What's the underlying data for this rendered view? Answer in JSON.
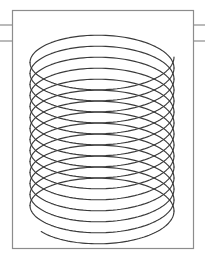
{
  "figure": {
    "kind": "technical-line-drawing",
    "background_color": "#ffffff",
    "frame": {
      "name": "drawing-border",
      "x": 12,
      "y": 10,
      "width": 181,
      "height": 238,
      "stroke_color": "#8c8c8c",
      "stroke_width": 1.2,
      "fill": "none"
    },
    "lead_lines": [
      {
        "name": "left-lead-line-upper",
        "x1": 0,
        "y1": 25,
        "x2": 12,
        "y2": 25
      },
      {
        "name": "left-lead-line-lower",
        "x1": 0,
        "y1": 41,
        "x2": 12,
        "y2": 41
      },
      {
        "name": "right-lead-line-upper",
        "x1": 193,
        "y1": 25,
        "x2": 205,
        "y2": 25
      },
      {
        "name": "right-lead-line-lower",
        "x1": 193,
        "y1": 41,
        "x2": 205,
        "y2": 41
      }
    ],
    "lead_line_stroke_color": "#8c8c8c",
    "lead_line_stroke_width": 1.2,
    "coil": {
      "name": "coil-spring",
      "stroke_color": "#3a3a3a",
      "stroke_width": 1.15,
      "fill": "none",
      "center_x": 102,
      "radius_x": 72,
      "radius_y": 30,
      "top_y": 57,
      "bottom_y": 200,
      "turns": 14,
      "turn_pitch": 11.0,
      "tail_end_x": 150,
      "tail_end_y": 228
    }
  }
}
